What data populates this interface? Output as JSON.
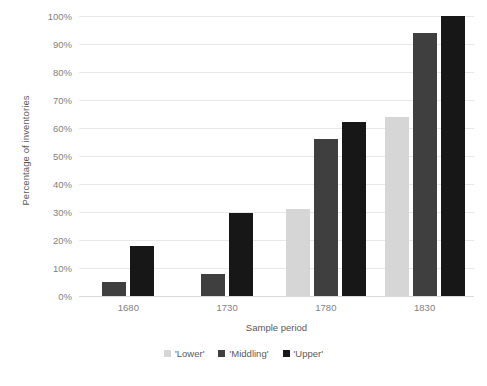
{
  "chart_data": {
    "type": "bar",
    "title": "",
    "xlabel": "Sample period",
    "ylabel": "Percentage of inventories",
    "categories": [
      "1680",
      "1730",
      "1780",
      "1830"
    ],
    "series": [
      {
        "name": "'Lower'",
        "color": "#d6d6d6",
        "values": [
          null,
          null,
          31,
          64
        ]
      },
      {
        "name": "'Middling'",
        "color": "#3f3f3f",
        "values": [
          5,
          8,
          56,
          94
        ]
      },
      {
        "name": "'Upper'",
        "color": "#171717",
        "values": [
          18,
          29.5,
          62,
          100
        ]
      }
    ],
    "ylim": [
      0,
      100
    ],
    "ytick_values": [
      0,
      10,
      20,
      30,
      40,
      50,
      60,
      70,
      80,
      90,
      100
    ],
    "ytick_labels": [
      "0%",
      "10%",
      "20%",
      "30%",
      "40%",
      "50%",
      "60%",
      "70%",
      "80%",
      "90%",
      "100%"
    ],
    "grid": true,
    "legend_position": "bottom",
    "legend_entries": [
      "'Lower'",
      "'Middling'",
      "'Upper'"
    ]
  }
}
